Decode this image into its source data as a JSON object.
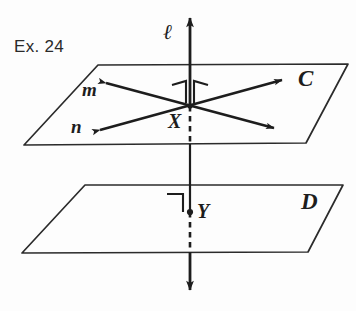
{
  "figure": {
    "exercise_label": "Ex. 24",
    "ink_color": "#1d1d1d",
    "background_color": "#fdfdfd",
    "width": 356,
    "height": 311
  },
  "labels": {
    "line_l": "ℓ",
    "line_m": "m",
    "line_n": "n",
    "plane_upper": "C",
    "plane_lower": "D",
    "point_x": "X",
    "point_y": "Y"
  },
  "geometry": {
    "plane_c": {
      "name": "upper-plane",
      "points": "98,65 348,64 306,143 24,145"
    },
    "plane_d": {
      "name": "lower-plane",
      "points": "85,185 343,185 308,252 22,253"
    },
    "line_l_solid_top": {
      "x1": 190,
      "y1": 16,
      "x2": 190,
      "y2": 106
    },
    "line_l_dashed_upper": {
      "x1": 190,
      "y1": 106,
      "x2": 190,
      "y2": 144
    },
    "line_l_solid_middle": {
      "x1": 190,
      "y1": 144,
      "x2": 190,
      "y2": 212
    },
    "line_l_dashed_lower": {
      "x1": 190,
      "y1": 212,
      "x2": 190,
      "y2": 252
    },
    "line_l_solid_bottom": {
      "x1": 190,
      "y1": 252,
      "x2": 190,
      "y2": 292
    },
    "line_m": {
      "x1": 106,
      "y1": 83,
      "x2": 274,
      "y2": 128
    },
    "line_n": {
      "x1": 100,
      "y1": 130,
      "x2": 282,
      "y2": 80
    },
    "point_x": {
      "cx": 190,
      "cy": 106
    },
    "point_y": {
      "cx": 190,
      "cy": 212
    }
  },
  "markers": {
    "right_angle_x_left": "right-angle-marker",
    "right_angle_x_right": "right-angle-marker",
    "right_angle_y": "right-angle-marker"
  },
  "label_positions": {
    "exercise": {
      "left": 14,
      "top": 38
    },
    "line_l": {
      "left": 163,
      "top": 22
    },
    "line_m": {
      "left": 82,
      "top": 80
    },
    "line_n": {
      "left": 71,
      "top": 117
    },
    "plane_c": {
      "left": 298,
      "top": 67
    },
    "plane_d": {
      "left": 301,
      "top": 190
    },
    "point_x": {
      "left": 168,
      "top": 111
    },
    "point_y": {
      "left": 197,
      "top": 201
    }
  }
}
